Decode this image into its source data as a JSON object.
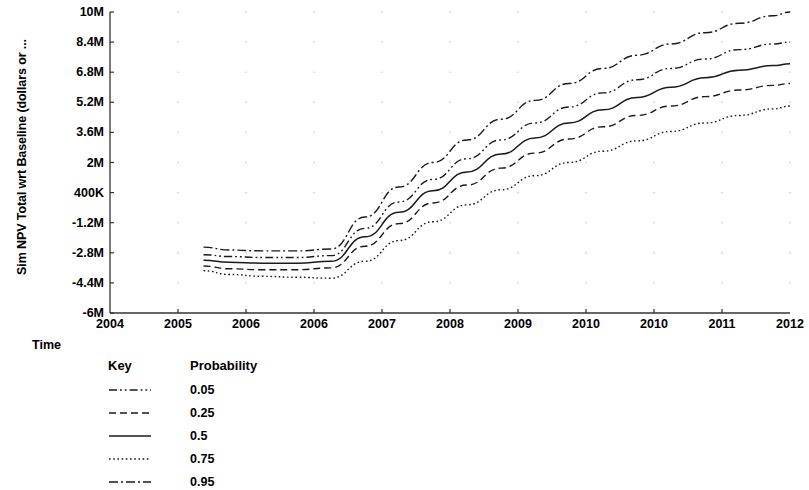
{
  "chart_data": {
    "type": "line",
    "title": "",
    "xlabel": "Time",
    "ylabel": "Sim NPV Total wrt Baseline (dollars or ...",
    "grid": "dots-at-tick-intersections",
    "legend_position": "below-plot-left",
    "x_tick_labels": [
      "2004",
      "2005",
      "2006",
      "2006",
      "2007",
      "2008",
      "2009",
      "2010",
      "2010",
      "2011",
      "2012"
    ],
    "y_tick_labels": [
      "10M",
      "8.4M",
      "6.8M",
      "5.2M",
      "3.6M",
      "2M",
      "400K",
      "-1.2M",
      "-2.8M",
      "-4.4M",
      "-6M"
    ],
    "y_tick_values": [
      10000000,
      8400000,
      6800000,
      5200000,
      3600000,
      2000000,
      400000,
      -1200000,
      -2800000,
      -4400000,
      -6000000
    ],
    "ylim": [
      -6000000,
      10000000
    ],
    "xlim": [
      2004.0,
      2012.0
    ],
    "x": [
      2005.1,
      2005.4,
      2005.8,
      2006.2,
      2006.6,
      2007.0,
      2007.4,
      2007.8,
      2008.2,
      2008.6,
      2009.0,
      2009.4,
      2009.8,
      2010.2,
      2010.6,
      2011.0,
      2011.4,
      2011.8,
      2012.0
    ],
    "series": [
      {
        "name": "0.95",
        "label": "0.95",
        "style": "dash-dot",
        "values": [
          -2500000,
          -2650000,
          -2700000,
          -2700000,
          -2600000,
          -900000,
          700000,
          2000000,
          3200000,
          4300000,
          5300000,
          6200000,
          7000000,
          7700000,
          8300000,
          8900000,
          9400000,
          9800000,
          10000000
        ]
      },
      {
        "name": "0.75",
        "label": "0.75",
        "style": "dash-dot-dot",
        "values": [
          -2900000,
          -3000000,
          -3050000,
          -3050000,
          -2950000,
          -1500000,
          -100000,
          1100000,
          2200000,
          3200000,
          4100000,
          4950000,
          5700000,
          6400000,
          7000000,
          7500000,
          8000000,
          8300000,
          8400000
        ]
      },
      {
        "name": "0.5",
        "label": "0.5",
        "style": "solid",
        "values": [
          -3200000,
          -3300000,
          -3350000,
          -3350000,
          -3250000,
          -1950000,
          -650000,
          500000,
          1500000,
          2450000,
          3300000,
          4100000,
          4800000,
          5450000,
          6000000,
          6500000,
          6900000,
          7150000,
          7250000
        ]
      },
      {
        "name": "0.25",
        "label": "0.25",
        "style": "dashed",
        "values": [
          -3500000,
          -3650000,
          -3700000,
          -3700000,
          -3600000,
          -2450000,
          -1250000,
          -150000,
          800000,
          1700000,
          2500000,
          3250000,
          3900000,
          4500000,
          5000000,
          5500000,
          5850000,
          6100000,
          6200000
        ]
      },
      {
        "name": "0.05",
        "label": "0.05",
        "style": "dotted",
        "values": [
          -3750000,
          -3950000,
          -4050000,
          -4100000,
          -4150000,
          -3250000,
          -2150000,
          -1150000,
          -250000,
          550000,
          1300000,
          2000000,
          2600000,
          3150000,
          3650000,
          4100000,
          4500000,
          4850000,
          5000000
        ]
      }
    ]
  },
  "axes": {
    "ylabel": "Sim NPV Total wrt Baseline (dollars or ...",
    "xlabel": "Time"
  },
  "legend": {
    "key_header": "Key",
    "probability_header": "Probability",
    "rows": [
      {
        "label": "0.05",
        "style": "dash-dot-dot"
      },
      {
        "label": "0.25",
        "style": "dashed"
      },
      {
        "label": "0.5",
        "style": "solid"
      },
      {
        "label": "0.75",
        "style": "dotted"
      },
      {
        "label": "0.95",
        "style": "dash-dot"
      }
    ]
  },
  "colors": {
    "line": "#1a1a1a",
    "axis": "#333333",
    "grid_dot": "#c8c8c8",
    "background": "#ffffff",
    "text": "#000000"
  }
}
